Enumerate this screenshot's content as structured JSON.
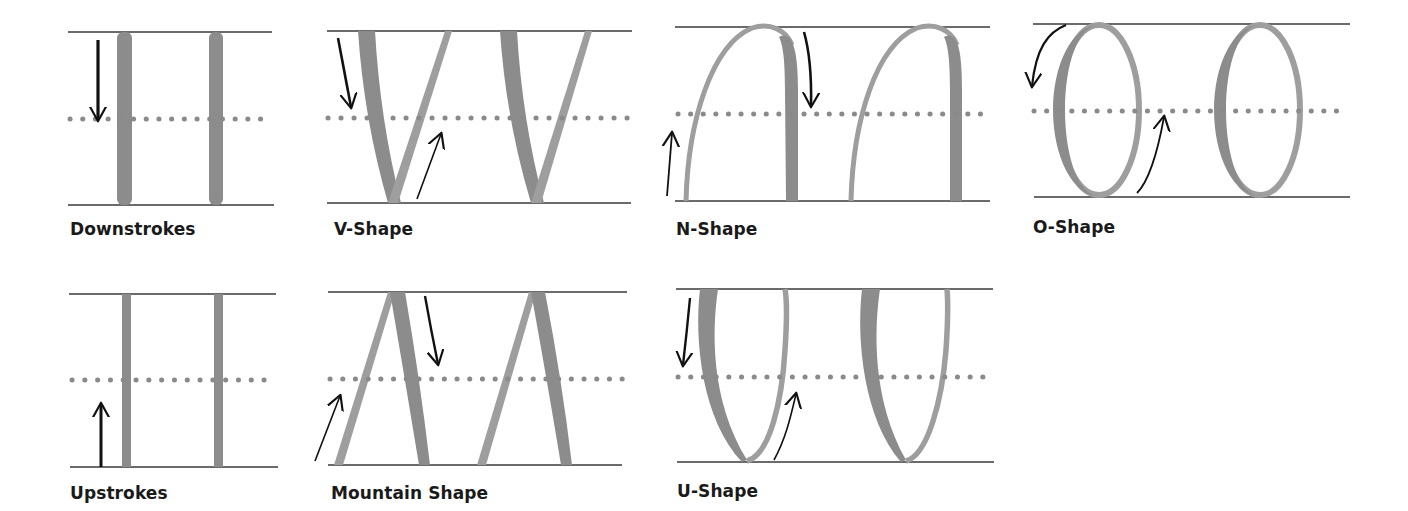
{
  "colors": {
    "guide_line": "#3a3a3a",
    "dotted_line": "#8a8a8a",
    "thick_stroke": "#8c8c8c",
    "thin_stroke": "#9e9e9e",
    "arrow": "#111111",
    "label": "#1a1a1a"
  },
  "panels": [
    {
      "id": "downstrokes",
      "label": "Downstrokes",
      "arrows": [
        "down"
      ]
    },
    {
      "id": "v-shape",
      "label": "V-Shape",
      "arrows": [
        "down",
        "up"
      ]
    },
    {
      "id": "n-shape",
      "label": "N-Shape",
      "arrows": [
        "up",
        "down"
      ]
    },
    {
      "id": "o-shape",
      "label": "O-Shape",
      "arrows": [
        "curved-down-left",
        "curved-up"
      ]
    },
    {
      "id": "upstrokes",
      "label": "Upstrokes",
      "arrows": [
        "up"
      ]
    },
    {
      "id": "mountain-shape",
      "label": "Mountain Shape",
      "arrows": [
        "up",
        "down"
      ]
    },
    {
      "id": "u-shape",
      "label": "U-Shape",
      "arrows": [
        "down",
        "curved-up"
      ]
    }
  ]
}
